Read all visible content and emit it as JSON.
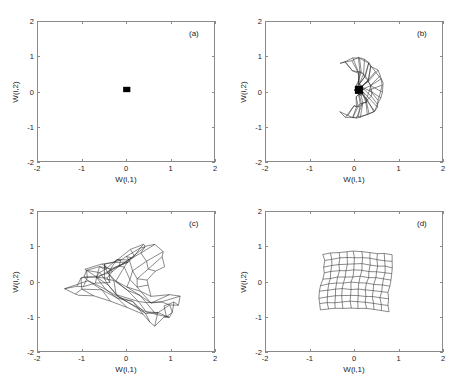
{
  "figure": {
    "background": "#ffffff",
    "line_color": "#2b2b2b",
    "axis_color": "#8a8a8a"
  },
  "chart_data": {
    "type": "line",
    "title": "",
    "panels": [
      {
        "tag": "(a)",
        "xlabel": "W(i,1)",
        "ylabel": "W(i,2)",
        "xlim": [
          -2,
          2
        ],
        "ylim": [
          -2,
          2
        ],
        "xticks": [
          -2,
          -1,
          0,
          1,
          2
        ],
        "yticks": [
          -2,
          -1,
          0,
          1,
          2
        ],
        "xticklabels": [
          "-2",
          "-1",
          "0",
          "1",
          "2"
        ],
        "yticklabels": [
          "-2",
          "-1",
          "0",
          "1",
          "2"
        ],
        "grid": false,
        "state": "initial",
        "grid_rows": 10,
        "grid_cols": 10,
        "extent_x": [
          -0.07,
          0.1
        ],
        "extent_y": [
          -0.02,
          0.14
        ],
        "jitter": 0.02
      },
      {
        "tag": "(b)",
        "xlabel": "W(i,1)",
        "ylabel": "W(i,2)",
        "xlim": [
          -2,
          2
        ],
        "ylim": [
          -2,
          2
        ],
        "xticks": [
          -2,
          -1,
          0,
          1,
          2
        ],
        "yticks": [
          -2,
          -1,
          0,
          1,
          2
        ],
        "xticklabels": [
          "-2",
          "-1",
          "0",
          "1",
          "2"
        ],
        "yticklabels": [
          "-2",
          "-1",
          "0",
          "1",
          "2"
        ],
        "grid": false,
        "state": "early-unfolding",
        "grid_rows": 10,
        "grid_cols": 10,
        "extent_x": [
          -0.55,
          0.62
        ],
        "extent_y": [
          -0.82,
          0.9
        ],
        "jitter": 0.1
      },
      {
        "tag": "(c)",
        "xlabel": "W(i,1)",
        "ylabel": "W(i,2)",
        "xlim": [
          -2,
          2
        ],
        "ylim": [
          -2,
          2
        ],
        "xticks": [
          -2,
          -1,
          0,
          1,
          2
        ],
        "yticks": [
          -2,
          -1,
          0,
          1,
          2
        ],
        "xticklabels": [
          "-2",
          "-1",
          "0",
          "1",
          "2"
        ],
        "yticklabels": [
          "-2",
          "-1",
          "0",
          "1",
          "2"
        ],
        "grid": false,
        "state": "partial-ordering",
        "grid_rows": 10,
        "grid_cols": 10,
        "extent_x": [
          -0.85,
          0.82
        ],
        "extent_y": [
          -0.78,
          0.72
        ],
        "jitter": 0.22
      },
      {
        "tag": "(d)",
        "xlabel": "W(i,1)",
        "ylabel": "W(i,2)",
        "xlim": [
          -2,
          2
        ],
        "ylim": [
          -2,
          2
        ],
        "xticks": [
          -2,
          -1,
          0,
          1,
          2
        ],
        "yticks": [
          -2,
          -1,
          0,
          1,
          2
        ],
        "xticklabels": [
          "-2",
          "-1",
          "0",
          "1",
          "2"
        ],
        "yticklabels": [
          "-2",
          "-1",
          "0",
          "1",
          "2"
        ],
        "grid": false,
        "state": "converged",
        "grid_rows": 10,
        "grid_cols": 10,
        "extent_x": [
          -0.72,
          0.82
        ],
        "extent_y": [
          -0.8,
          0.8
        ],
        "jitter": 0.035
      }
    ]
  }
}
